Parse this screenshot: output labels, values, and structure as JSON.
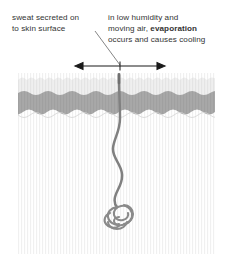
{
  "figure": {
    "annotations": {
      "left": {
        "line1": "sweat secreted on",
        "line2": "to skin surface"
      },
      "right": {
        "line1": "in low humidity and",
        "line2_prefix": "moving air, ",
        "line2_emphasis": "evaporation",
        "line3": "occurs and causes cooling"
      }
    },
    "colors": {
      "text": "#333333",
      "leader_line": "#555555",
      "arrow": "#1a1a1a",
      "epidermis": "#eeeeee",
      "dermis_band": "#a8a8a8",
      "hypodermis": "#f7f7f7",
      "duct": "#808080",
      "outline": "#c9c9c9",
      "background": "#ffffff"
    },
    "parts": {
      "epidermis": "epidermis-layer",
      "dermis_band": "dermis-layer",
      "hypodermis": "hypodermis-layer",
      "duct": "sweat-duct",
      "gland": "coiled-sweat-gland",
      "pore": "skin-pore",
      "arrow": "evaporation-spread-arrow",
      "leader": "leader-line"
    }
  }
}
